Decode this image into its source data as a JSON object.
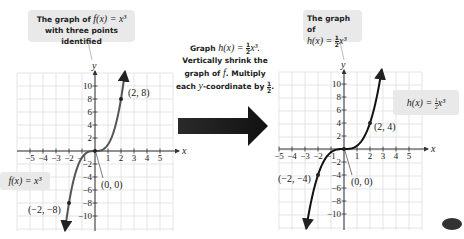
{
  "left_panel": {
    "callout_line1": "The graph of f(x) = x³",
    "callout_line1_prefix": "The graph of ",
    "callout_line1_math": "f(x) = x³",
    "callout_line2": "with three points identified",
    "function_label": "f(x) = x³",
    "points": [
      {
        "label": "(2, 8)",
        "x": 2,
        "y": 8
      },
      {
        "label": "(0, 0)",
        "x": 0,
        "y": 0
      },
      {
        "label": "(−2, −8)",
        "x": -2,
        "y": -8
      }
    ]
  },
  "middle": {
    "line1_prefix": "Graph ",
    "line1_math": "h(x) = ",
    "line1_suffix": "x³.",
    "line2": "Vertically shrink the",
    "line3_prefix": "graph of ",
    "line3_math": "f",
    "line3_suffix": ". Multiply",
    "line4_prefix": "each ",
    "line4_math": "y",
    "line4_suffix": "-coordinate by",
    "fraction_num": "1",
    "fraction_den": "2",
    "arrow": "right-arrow"
  },
  "right_panel": {
    "callout_line1": "The graph of",
    "callout_line2_math": "h(x) = ",
    "callout_line2_suffix": "x³",
    "function_label_math": "h(x) = ",
    "function_label_suffix": "x³",
    "points": [
      {
        "label": "(2, 4)",
        "x": 2,
        "y": 4
      },
      {
        "label": "(0, 0)",
        "x": 0,
        "y": 0
      },
      {
        "label": "(−2, −4)",
        "x": -2,
        "y": -4
      }
    ]
  },
  "axes": {
    "x_label": "x",
    "y_label": "y",
    "x_ticks": [
      "−5",
      "−4",
      "−3",
      "−2",
      "−1",
      "1",
      "2",
      "3",
      "4",
      "5"
    ],
    "y_ticks": [
      "10",
      "8",
      "6",
      "4",
      "2",
      "−2",
      "−4",
      "−6",
      "−8",
      "−10"
    ]
  },
  "chart_data": [
    {
      "type": "line",
      "title": "The graph of f(x) = x³ with three points identified",
      "xlabel": "x",
      "ylabel": "y",
      "xlim": [
        -6,
        6
      ],
      "ylim": [
        -12,
        12
      ],
      "grid": true,
      "series": [
        {
          "name": "f(x) = x³",
          "x": [
            -2.3,
            -2,
            -1,
            0,
            1,
            2,
            2.3
          ],
          "values": [
            -12.2,
            -8,
            -1,
            0,
            1,
            8,
            12.2
          ]
        }
      ],
      "annotations": [
        "(2, 8)",
        "(0, 0)",
        "(−2, −8)"
      ]
    },
    {
      "type": "line",
      "title": "The graph of h(x) = ½x³",
      "xlabel": "x",
      "ylabel": "y",
      "xlim": [
        -6,
        6
      ],
      "ylim": [
        -12,
        12
      ],
      "grid": true,
      "series": [
        {
          "name": "h(x) = ½x³",
          "x": [
            -2.9,
            -2,
            -1,
            0,
            1,
            2,
            2.9
          ],
          "values": [
            -12.2,
            -4,
            -0.5,
            0,
            0.5,
            4,
            12.2
          ]
        }
      ],
      "annotations": [
        "(2, 4)",
        "(0, 0)",
        "(−2, −4)"
      ]
    }
  ]
}
